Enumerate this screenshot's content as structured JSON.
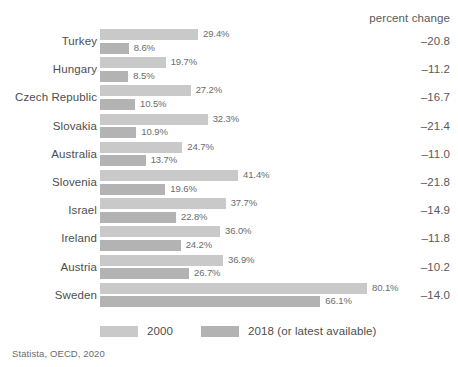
{
  "chart_data": {
    "type": "bar",
    "title": "",
    "subtitle": "",
    "xlabel": "",
    "ylabel": "",
    "orientation": "horizontal",
    "grid": false,
    "legend_position": "bottom-left",
    "xlim": [
      0,
      80.1
    ],
    "categories": [
      "Turkey",
      "Hungary",
      "Czech Republic",
      "Slovakia",
      "Australia",
      "Slovenia",
      "Israel",
      "Ireland",
      "Austria",
      "Sweden"
    ],
    "series": [
      {
        "name": "2000",
        "color": "#c9c9c9",
        "values": [
          29.4,
          19.7,
          27.2,
          32.3,
          24.7,
          41.4,
          37.7,
          36.0,
          36.9,
          80.1
        ],
        "labels": [
          "29.4%",
          "19.7%",
          "27.2%",
          "32.3%",
          "24.7%",
          "41.4%",
          "37.7%",
          "36.0%",
          "36.9%",
          "80.1%"
        ]
      },
      {
        "name": "2018 (or latest available)",
        "color": "#b3b3b3",
        "values": [
          8.6,
          8.5,
          10.5,
          10.9,
          13.7,
          19.6,
          22.8,
          24.2,
          26.7,
          66.1
        ],
        "labels": [
          "8.6%",
          "8.5%",
          "10.5%",
          "10.9%",
          "13.7%",
          "19.6%",
          "22.8%",
          "24.2%",
          "26.7%",
          "66.1%"
        ]
      }
    ],
    "annotations": {
      "column_header": "percent change",
      "percent_change_values": [
        "–20.8",
        "–11.2",
        "–16.7",
        "–21.4",
        "–11.0",
        "–21.8",
        "–14.9",
        "–11.8",
        "–10.2",
        "–14.0"
      ]
    }
  },
  "header": {
    "percent_change_label": "percent change"
  },
  "legend": {
    "items": [
      {
        "label": "2000",
        "color": "#c9c9c9"
      },
      {
        "label": "2018 (or latest available)",
        "color": "#b3b3b3"
      }
    ]
  },
  "source": {
    "text": "Statista, OECD, 2020"
  }
}
